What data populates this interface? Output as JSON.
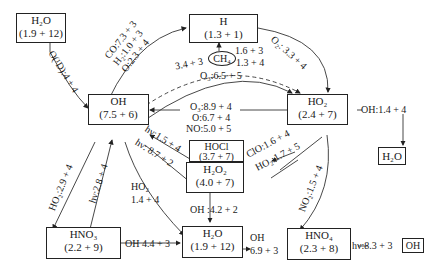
{
  "diagram": {
    "type": "chemical reaction network",
    "nodes": {
      "h2o_top": {
        "species": "H₂O",
        "value": "(1.9 + 12)"
      },
      "h": {
        "species": "H",
        "value": "(1.3 + 1)"
      },
      "ch4": {
        "species": "CH₄"
      },
      "oh": {
        "species": "OH",
        "value": "(7.5 + 6)"
      },
      "ho2": {
        "species": "HO₂",
        "value": "(2.4 + 7)"
      },
      "h2o_right": {
        "species": "H₂O"
      },
      "hocl": {
        "species": "HOCl",
        "value": "(3.7 + 7)"
      },
      "h2o2": {
        "species": "H₂O₂",
        "value": "(4.0 + 7)"
      },
      "hno3": {
        "species": "HNO₃",
        "value": "(2.2 + 9)"
      },
      "h2o_bottom": {
        "species": "H₂O",
        "value": "(1.9 + 12)"
      },
      "hno4": {
        "species": "HNO₄",
        "value": "(2.3 + 8)"
      },
      "oh_small": {
        "species": "OH"
      }
    },
    "edges": {
      "h2o_to_oh": "O(¹D):4 + 4",
      "oh_to_h_co": "CO:7.3 + 3",
      "oh_to_h_h2": "H₂:1.0 + 3",
      "oh_to_h_o": "O:2.3 + 4",
      "h_to_ho2": "O₂: 3.3 + 4",
      "ch4_1": "1.6 + 3",
      "ch4_2": "1.3 + 4",
      "dashed_oh": "3.4 + 3",
      "o3_ho2": "O₃:6.5 + 5",
      "ho2_to_oh_o3": "O₃:8.9 + 4",
      "ho2_to_oh_o": "O:6.7 + 4",
      "ho2_to_oh_no": "NO:5.0 + 5",
      "ho2_oh_loss": "OH:1.4 + 4",
      "hocl_photo": "hν:1.5 + 4",
      "h2o2_photo": "hν: 8.7 + 2",
      "clo": "ClO:1.6 + 4",
      "ho2_self": "HO₂:1.7 + 5",
      "no2": "NO₂:1.5 + 4",
      "hno3_ho2": "HO₂:2.9 + 4",
      "hno3_photo": "hν:2.8 + 4",
      "oh_ho2_label": "HO₂",
      "oh_ho2_value": "1.4 + 4",
      "h2o2_oh": "OH :4.2 + 2",
      "hno3_oh": "OH 4.4 + 3",
      "hno4_oh_label": "OH",
      "hno4_oh_value": "6.9 + 3",
      "hno4_photo": "hν:8.3 + 3"
    }
  }
}
